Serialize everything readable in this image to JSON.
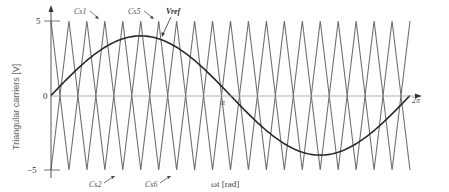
{
  "chart_data": {
    "type": "line",
    "title": "",
    "xlabel": "ωt [rad]",
    "ylabel": "Triangular carriers [V]",
    "xlim": [
      0,
      6.2832
    ],
    "ylim": [
      -5,
      5
    ],
    "x_ticks": [
      {
        "value": 0,
        "label": "0"
      },
      {
        "value": 3.1416,
        "label": "π"
      },
      {
        "value": 6.2832,
        "label": "2π"
      }
    ],
    "y_ticks": [
      {
        "value": 5,
        "label": "5"
      },
      {
        "value": 0,
        "label": "0"
      },
      {
        "value": -5,
        "label": "−5"
      }
    ],
    "grid": false,
    "series": [
      {
        "name": "Vref",
        "kind": "sine",
        "amplitude": 4.0,
        "periods": 1,
        "color": "#2a2a2a"
      },
      {
        "name": "Carrier A",
        "kind": "triangle",
        "amplitude": 5,
        "periods": 10,
        "start_value": 5,
        "color": "#707070"
      },
      {
        "name": "Carrier B",
        "kind": "triangle",
        "amplitude": 5,
        "periods": 10,
        "start_value": -5,
        "color": "#707070"
      }
    ],
    "annotations": [
      {
        "text": "Cs1",
        "x_px": 75,
        "y_px": 12,
        "arrow_to": [
          97,
          18
        ]
      },
      {
        "text": "Cs5",
        "x_px": 128,
        "y_px": 12,
        "arrow_to": [
          152,
          18
        ]
      },
      {
        "text": "Vref",
        "x_px": 167,
        "y_px": 12,
        "arrow_to": [
          160,
          36
        ]
      },
      {
        "text": "Cs2",
        "x_px": 90,
        "y_px": 185,
        "arrow_to": [
          112,
          176
        ]
      },
      {
        "text": "Cs6",
        "x_px": 145,
        "y_px": 185,
        "arrow_to": [
          168,
          176
        ]
      }
    ]
  },
  "labels": {
    "xlabel": "ωt [rad]",
    "ylabel": "Triangular carriers [V]",
    "tick_5": "5",
    "tick_0": "0",
    "tick_m5": "−5",
    "tick_pi": "π",
    "tick_2pi": "2π",
    "cs1": "Cs1",
    "cs5": "Cs5",
    "vref": "Vref",
    "cs2": "Cs2",
    "cs6": "Cs6"
  }
}
